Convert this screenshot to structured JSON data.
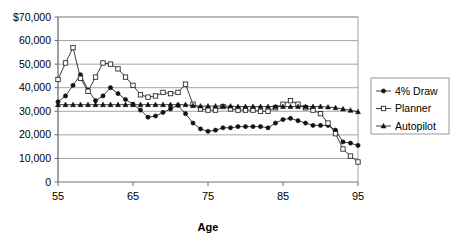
{
  "chart_data": {
    "type": "line",
    "title": "",
    "xlabel": "Age",
    "ylabel": "",
    "xlim": [
      55,
      95
    ],
    "ylim": [
      0,
      70000
    ],
    "grid": true,
    "legend_position": "right",
    "xticks": [
      55,
      65,
      75,
      85,
      95
    ],
    "xtick_labels": [
      "55",
      "65",
      "75",
      "85",
      "95"
    ],
    "yticks": [
      0,
      10000,
      20000,
      30000,
      40000,
      50000,
      60000,
      70000
    ],
    "ytick_labels": [
      "0",
      "10,000",
      "20,000",
      "30,000",
      "40,000",
      "50,000",
      "60,000",
      "$70,000"
    ],
    "x": [
      55,
      56,
      57,
      58,
      59,
      60,
      61,
      62,
      63,
      64,
      65,
      66,
      67,
      68,
      69,
      70,
      71,
      72,
      73,
      74,
      75,
      76,
      77,
      78,
      79,
      80,
      81,
      82,
      83,
      84,
      85,
      86,
      87,
      88,
      89,
      90,
      91,
      92,
      93,
      94,
      95
    ],
    "series": [
      {
        "name": "4% Draw",
        "marker": "filled-circle",
        "values": [
          34000,
          36500,
          41000,
          45500,
          39000,
          34500,
          36500,
          40000,
          37500,
          35000,
          33000,
          30500,
          27500,
          28000,
          29500,
          31000,
          32500,
          29000,
          25000,
          22500,
          21500,
          22000,
          23000,
          23000,
          23500,
          23500,
          23500,
          23500,
          23000,
          25000,
          26500,
          27000,
          26000,
          25000,
          24000,
          24000,
          24000,
          22000,
          17000,
          16500,
          15500
        ]
      },
      {
        "name": "Planner",
        "marker": "open-square",
        "values": [
          43500,
          50500,
          57000,
          44000,
          38500,
          44500,
          50500,
          50000,
          48000,
          44500,
          41000,
          37000,
          36000,
          36500,
          38000,
          37500,
          38000,
          41500,
          33000,
          31000,
          30500,
          30500,
          32000,
          31000,
          30500,
          30500,
          30500,
          30000,
          30000,
          31500,
          33000,
          34500,
          33000,
          31500,
          30500,
          29000,
          25000,
          20500,
          14000,
          11000,
          8500
        ]
      },
      {
        "name": "Autopilot",
        "marker": "filled-triangle",
        "values": [
          32800,
          32800,
          32800,
          32800,
          32800,
          32800,
          32800,
          32800,
          32800,
          32800,
          32800,
          32800,
          32800,
          32800,
          32800,
          32800,
          32800,
          32800,
          32400,
          32200,
          32200,
          32200,
          32200,
          32200,
          32000,
          32000,
          32000,
          32000,
          32000,
          32000,
          32000,
          32000,
          32000,
          32000,
          32000,
          32000,
          31800,
          31500,
          31000,
          30400,
          29800
        ]
      }
    ]
  },
  "legend": {
    "entries": [
      {
        "label": "4% Draw",
        "marker": "filled-circle"
      },
      {
        "label": "Planner",
        "marker": "open-square"
      },
      {
        "label": "Autopilot",
        "marker": "filled-triangle"
      }
    ]
  },
  "colors": {
    "series_line": "#1a1a1a",
    "gridline": "#9a9a9a",
    "frame": "#9a9a9a",
    "background": "#ffffff",
    "text": "#000000"
  }
}
